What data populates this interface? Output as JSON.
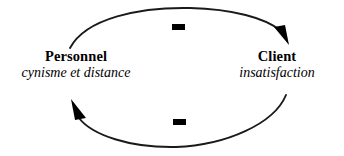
{
  "diagram": {
    "type": "causal-loop-diagram",
    "language": "fr",
    "background_color": "#ffffff",
    "stroke_color": "#1a1a1a",
    "text_color": "#000000",
    "nodes": [
      {
        "id": "personnel",
        "title": "Personnel",
        "subtitle": "cynisme et distance"
      },
      {
        "id": "client",
        "title": "Client",
        "subtitle": "insatisfaction"
      }
    ],
    "links": [
      {
        "id": "personnel-to-client",
        "from": "personnel",
        "to": "client",
        "polarity": "-",
        "position": "top"
      },
      {
        "id": "client-to-personnel",
        "from": "client",
        "to": "personnel",
        "polarity": "-",
        "position": "bottom"
      }
    ],
    "polarity_top": "-",
    "polarity_bottom": "-"
  }
}
